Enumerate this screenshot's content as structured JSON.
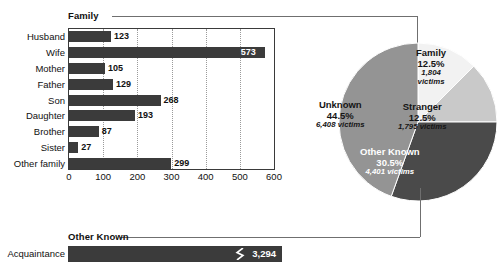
{
  "chart_data": [
    {
      "type": "bar",
      "title": "Family",
      "orientation": "horizontal",
      "categories": [
        "Husband",
        "Wife",
        "Mother",
        "Father",
        "Son",
        "Daughter",
        "Brother",
        "Sister",
        "Other family"
      ],
      "values": [
        123,
        573,
        105,
        129,
        268,
        193,
        87,
        27,
        299
      ],
      "xlabel": "",
      "ylabel": "",
      "xlim": [
        0,
        600
      ],
      "xticks": [
        0,
        100,
        200,
        300,
        400,
        500,
        600
      ],
      "xticklabels": [
        "0",
        "100",
        "200",
        "300",
        "400",
        "500",
        "600"
      ],
      "grid": "vertical-dotted",
      "legend": "none",
      "bar_color": "#3b3b3b"
    },
    {
      "type": "pie",
      "title": "",
      "start_angle_deg": 0,
      "direction": "clockwise",
      "slices": [
        {
          "label": "Family",
          "percent": 12.5,
          "victims": "1,804",
          "victims_suffix": "victims",
          "color": "#f2f2f2",
          "text_color": "#151515"
        },
        {
          "label": "Stranger",
          "percent": 12.5,
          "victims": "1,795",
          "victims_suffix": "victims",
          "color": "#c9c9c9",
          "text_color": "#151515"
        },
        {
          "label": "Other Known",
          "percent": 30.5,
          "victims": "4,401",
          "victims_suffix": "victims",
          "color": "#4a4a4a",
          "text_color": "#ffffff"
        },
        {
          "label": "Unknown",
          "percent": 44.5,
          "victims": "6,408",
          "victims_suffix": "victims",
          "color": "#949494",
          "text_color": "#151515"
        }
      ],
      "legend": "labels-inside-slices"
    },
    {
      "type": "bar",
      "title": "Other Known",
      "orientation": "horizontal",
      "categories": [
        "Acquaintance"
      ],
      "values": [
        3294
      ],
      "value_labels": [
        "3,294"
      ],
      "axis_break": true,
      "bar_color": "#3b3b3b"
    }
  ],
  "family_section": {
    "label": "Family",
    "plot": {
      "x_min": 0,
      "x_max": 600,
      "ticks": [
        {
          "value": 0,
          "label": "0"
        },
        {
          "value": 100,
          "label": "100"
        },
        {
          "value": 200,
          "label": "200"
        },
        {
          "value": 300,
          "label": "300"
        },
        {
          "value": 400,
          "label": "400"
        },
        {
          "value": 500,
          "label": "500"
        },
        {
          "value": 600,
          "label": "600"
        }
      ],
      "bars": [
        {
          "category": "Husband",
          "value": 123,
          "value_label": "123",
          "label_position": "outside"
        },
        {
          "category": "Wife",
          "value": 573,
          "value_label": "573",
          "label_position": "inside"
        },
        {
          "category": "Mother",
          "value": 105,
          "value_label": "105",
          "label_position": "outside"
        },
        {
          "category": "Father",
          "value": 129,
          "value_label": "129",
          "label_position": "outside"
        },
        {
          "category": "Son",
          "value": 268,
          "value_label": "268",
          "label_position": "outside"
        },
        {
          "category": "Daughter",
          "value": 193,
          "value_label": "193",
          "label_position": "outside"
        },
        {
          "category": "Brother",
          "value": 87,
          "value_label": "87",
          "label_position": "outside"
        },
        {
          "category": "Sister",
          "value": 27,
          "value_label": "27",
          "label_position": "outside"
        },
        {
          "category": "Other family",
          "value": 299,
          "value_label": "299",
          "label_position": "outside"
        }
      ]
    }
  },
  "pie_section": {
    "slices": [
      {
        "label": "Family",
        "percent_label": "12.5%",
        "victims_label": "1,804",
        "victims_suffix": "victims"
      },
      {
        "label": "Stranger",
        "percent_label": "12.5%",
        "victims_label": "1,795 victims"
      },
      {
        "label": "Other Known",
        "percent_label": "30.5%",
        "victims_label": "4,401 victims"
      },
      {
        "label": "Unknown",
        "percent_label": "44.5%",
        "victims_label": "6,408 victims"
      }
    ]
  },
  "other_known_section": {
    "label": "Other Known",
    "bar": {
      "category": "Acquaintance",
      "value": 3294,
      "value_label": "3,294"
    }
  },
  "colors": {
    "bar_fill": "#3b3b3b",
    "slice_family": "#f2f2f2",
    "slice_stranger": "#c9c9c9",
    "slice_other_known": "#4a4a4a",
    "slice_unknown": "#949494",
    "bracket_line": "#6f6f6f",
    "axis_line": "#3a3a3a"
  }
}
